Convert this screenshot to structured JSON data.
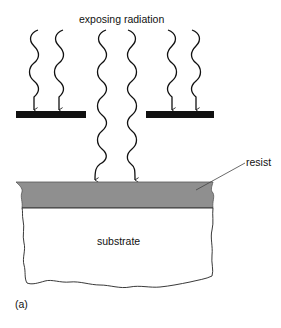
{
  "figure": {
    "title_label": "exposing radiation",
    "resist_label": "resist",
    "substrate_label": "substrate",
    "panel_label": "(a)"
  },
  "colors": {
    "background": "#ffffff",
    "mask": "#111111",
    "resist": "#8f8f8f",
    "line": "#222222"
  },
  "elements": {
    "masks": [
      {
        "name": "left-mask",
        "x": 16,
        "y": 111,
        "width": 70,
        "height": 7
      },
      {
        "name": "right-mask",
        "x": 146,
        "y": 111,
        "width": 68,
        "height": 7
      }
    ],
    "blocked_waves": [
      34,
      59,
      172,
      196
    ],
    "transmitted_waves": [
      95,
      135
    ]
  }
}
